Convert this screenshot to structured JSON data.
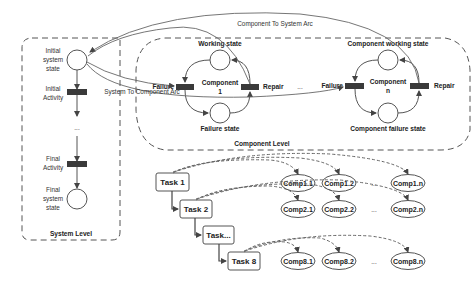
{
  "system_level": {
    "title": "System Level",
    "initial_state": [
      "Initial",
      "system",
      "state"
    ],
    "initial_activity": [
      "Initial",
      "Activity"
    ],
    "ellipsis": "...",
    "final_activity": [
      "Final",
      "Activity"
    ],
    "final_state": [
      "Final",
      "system",
      "state"
    ]
  },
  "component_level": {
    "title": "Component Level",
    "component_1": {
      "working_label": "Working state",
      "failure_label": "Failure state",
      "name": [
        "Component",
        "1"
      ],
      "failure_transition": "Failure",
      "repair_transition": "Repair"
    },
    "between_ellipsis": "...",
    "component_n": {
      "working_label": "Component working state",
      "failure_label": "Component failure state",
      "name": [
        "Component",
        "n"
      ],
      "failure_transition": "Failure",
      "repair_transition": "Repair"
    }
  },
  "arcs": {
    "component_to_system": "Component To System Arc",
    "system_to_component": "System To Component Arc"
  },
  "tasks": [
    {
      "label": "Task 1",
      "comps": [
        "Comp1.1",
        "Comp1.2",
        "...",
        "Comp1.n"
      ]
    },
    {
      "label": "Task 2",
      "comps": [
        "Comp2.1",
        "Comp2.2",
        "...",
        "Comp2.n"
      ]
    },
    {
      "label": "Task...",
      "comps": []
    },
    {
      "label": "Task 8",
      "comps": [
        "Comp8.1",
        "Comp8.2",
        "...",
        "Comp8.n"
      ]
    }
  ],
  "colors": {
    "stroke": "#555555",
    "transition_fill": "#3a3a3a",
    "dashed": "#555555",
    "text": "#222222"
  }
}
